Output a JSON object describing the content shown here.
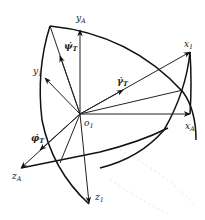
{
  "diagram": {
    "type": "coordinate-frame-rotation",
    "origin": {
      "label": "o",
      "sub": "1"
    },
    "axes": [
      {
        "id": "yA",
        "label": "y",
        "sub": "A"
      },
      {
        "id": "y1",
        "label": "y",
        "sub": "1"
      },
      {
        "id": "x1",
        "label": "x",
        "sub": "1"
      },
      {
        "id": "xA",
        "label": "x",
        "sub": "A"
      },
      {
        "id": "zA",
        "label": "z",
        "sub": "A"
      },
      {
        "id": "z1",
        "label": "z",
        "sub": "1"
      }
    ],
    "rates": [
      {
        "id": "psi_dot",
        "label": "ψ̇",
        "sub": "T"
      },
      {
        "id": "gamma_dot",
        "label": "γ̇",
        "sub": "T"
      },
      {
        "id": "phi_dot",
        "label": "φ̇",
        "sub": "T"
      }
    ],
    "colors": {
      "stroke": "#111111",
      "background": "#ffffff"
    }
  }
}
